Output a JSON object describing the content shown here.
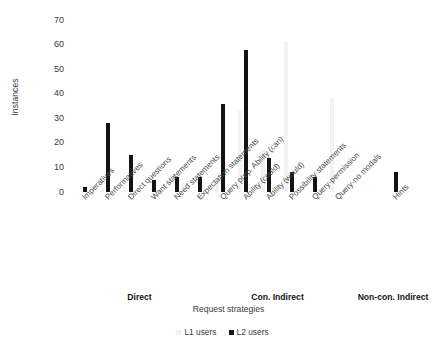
{
  "chart_data": {
    "type": "bar",
    "title": "",
    "xlabel": "Request strategies",
    "ylabel": "Instances",
    "ylim": [
      0,
      70
    ],
    "yticks": [
      0,
      10,
      20,
      30,
      40,
      50,
      60,
      70
    ],
    "grid": false,
    "legend_position": "bottom",
    "categories": [
      "Imperatives",
      "Performatives",
      "Direct questions",
      "Want statements",
      "Need statements",
      "Expectation statements",
      "Query prep. Ability (can)",
      "Ability (could)",
      "Ability (would)",
      "Possibility statements",
      "Query-permission",
      "Query-no modals",
      "Hints"
    ],
    "groups": [
      {
        "label": "Direct",
        "categories": [
          "Imperatives",
          "Performatives",
          "Direct questions",
          "Want statements",
          "Need statements",
          "Expectation statements"
        ]
      },
      {
        "label": "Con. Indirect",
        "categories": [
          "Query prep. Ability (can)",
          "Ability (could)",
          "Ability (would)",
          "Possibility statements",
          "Query-permission",
          "Query-no modals"
        ]
      },
      {
        "label": "Non-con. Indirect",
        "categories": [
          "Hints"
        ]
      }
    ],
    "series": [
      {
        "name": "L1 users",
        "color": "#f2f2f2",
        "values": [
          0,
          1,
          1,
          0,
          0,
          0,
          5,
          33,
          17,
          61,
          0,
          38,
          0
        ]
      },
      {
        "name": "L2 users",
        "color": "#131313",
        "values": [
          2,
          28,
          15,
          5,
          6,
          6,
          36,
          58,
          14,
          8,
          6,
          0,
          8
        ]
      }
    ]
  },
  "axes": {
    "y_title": "Instances",
    "x_title": "Request strategies"
  },
  "legend": {
    "items": [
      {
        "label": "L1 users",
        "marker": "square-light"
      },
      {
        "label": "L2 users",
        "marker": "square-dark"
      }
    ]
  }
}
